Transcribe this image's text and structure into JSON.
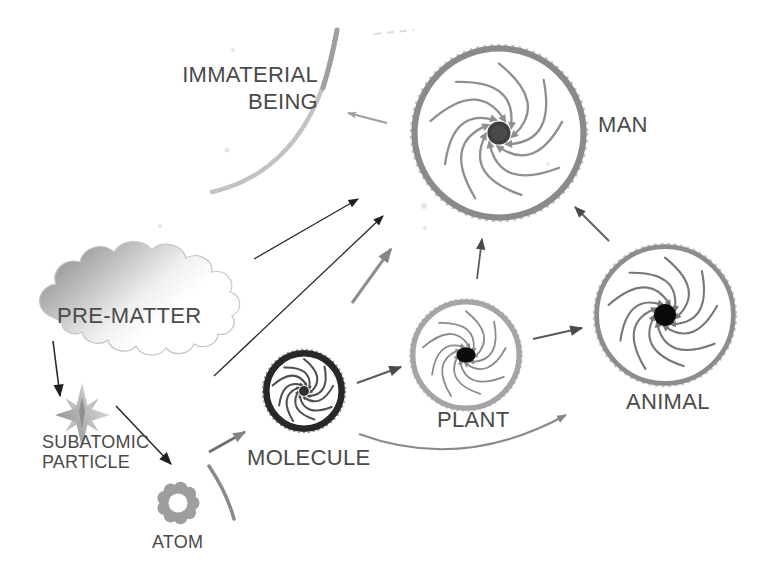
{
  "diagram": {
    "nodes": {
      "immaterial_being": {
        "line1": "IMMATERIAL",
        "line2": "BEING"
      },
      "man": {
        "label": "MAN"
      },
      "animal": {
        "label": "ANIMAL"
      },
      "plant": {
        "label": "PLANT"
      },
      "molecule": {
        "label": "MOLECULE"
      },
      "atom": {
        "label": "ATOM"
      },
      "subatomic_particle": {
        "line1": "SUBATOMIC",
        "line2": "PARTICLE"
      },
      "pre_matter": {
        "label": "PRE-MATTER"
      }
    },
    "edges": [
      {
        "from": "PRE-MATTER",
        "to": "SUBATOMIC PARTICLE",
        "style": "straight-black"
      },
      {
        "from": "SUBATOMIC PARTICLE",
        "to": "ATOM",
        "style": "straight-black"
      },
      {
        "from": "ATOM",
        "to": "MOLECULE",
        "style": "straight-gray"
      },
      {
        "from": "MOLECULE",
        "to": "PLANT",
        "style": "straight-dark"
      },
      {
        "from": "PLANT",
        "to": "ANIMAL",
        "style": "straight-dark"
      },
      {
        "from": "MOLECULE",
        "to": "ANIMAL",
        "style": "curved-gray"
      },
      {
        "from": "PLANT",
        "to": "MAN",
        "style": "straight-dark"
      },
      {
        "from": "ANIMAL",
        "to": "MAN",
        "style": "straight-dark"
      },
      {
        "from": "PRE-MATTER",
        "to": "IMMATERIAL BEING / MAN",
        "style": "long-straight-black"
      },
      {
        "from": "MOLECULE",
        "to": "IMMATERIAL BEING / MAN",
        "style": "long-straight-black"
      },
      {
        "from": "MOLECULE",
        "to": "MAN",
        "style": "short-gray"
      },
      {
        "from": "MAN",
        "to": "IMMATERIAL BEING",
        "style": "short-light-gray"
      }
    ],
    "colors": {
      "background": "#ffffff",
      "ink": "#4a4a4a",
      "pencil_gray": "#8a8a8a",
      "arrow_black": "#2a2a2a",
      "molecule_outline": "#282828",
      "center_black": "#0a0a0a",
      "cloud_dark_gray": "#7e7e7e",
      "arc_light_gray": "#c0c0c0"
    }
  }
}
